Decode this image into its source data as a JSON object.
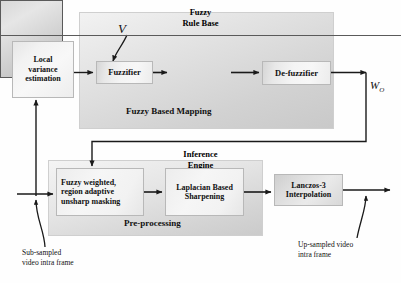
{
  "diagram": {
    "containers": [
      {
        "id": "fuzzy_mapping",
        "label": "Fuzzy Based Mapping"
      },
      {
        "id": "preprocessing",
        "label": "Pre-processing"
      }
    ],
    "boxes": {
      "local_variance": {
        "line1": "Local",
        "line2": "variance",
        "line3": "estimation"
      },
      "fuzzifier": {
        "line1": "Fuzzifier"
      },
      "fuzzy_rule_base": {
        "line1": "Fuzzy",
        "line2": "Rule Base"
      },
      "inference_engine": {
        "line1": "Inference",
        "line2": "Engine"
      },
      "defuzzifier": {
        "line1": "De-fuzzifier"
      },
      "fuzzy_weighted": {
        "line1": "Fuzzy weighted,",
        "line2": "region adaptive",
        "line3": "unsharp masking"
      },
      "laplacian": {
        "line1": "Laplacian Based",
        "line2": "Sharpening"
      },
      "lanczos": {
        "line1": "Lanczos-3",
        "line2": "Interpolation"
      }
    },
    "signals": {
      "variance_symbol": "V",
      "weight_symbol": "W",
      "weight_subscript": "O"
    },
    "annotations": {
      "input": {
        "line1": "Sub-sampled",
        "line2": "video intra frame"
      },
      "output": {
        "line1": "Up-sampled video",
        "line2": "intra frame"
      }
    },
    "colors": {
      "wire": "#1a1a1a",
      "container_border": "#cfcfcf",
      "box_border": "#b8b8b8",
      "emphasis_border": "#5a5a5a",
      "background": "#fefefe"
    }
  }
}
